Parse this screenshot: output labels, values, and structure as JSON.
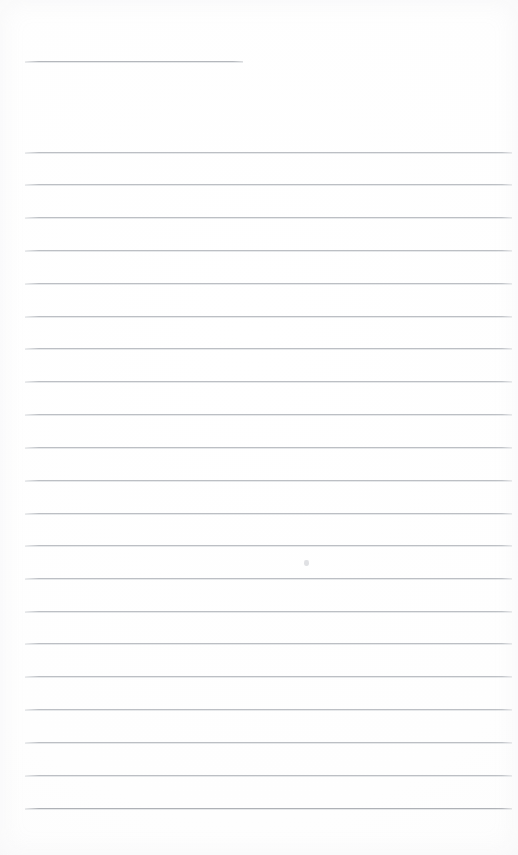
{
  "document": {
    "kind": "blank-ruled-page",
    "title_text": "",
    "body_text": "",
    "visible_text_count": 0,
    "page_background_color": "#ffffff",
    "rule_color": "#bcbfc4",
    "header_rule_color": "#b4b7bc",
    "last_rule_color": "#aeb1b6",
    "page_width": 518,
    "page_height": 855
  },
  "header_rule": {
    "label": "",
    "x": 25,
    "y": 61,
    "width": 218
  },
  "body_rules": {
    "label": "",
    "x": 25,
    "width": 487,
    "count": 21,
    "spacing": 32.8,
    "y_positions": [
      152,
      184,
      217,
      250,
      283,
      316,
      348,
      381,
      414,
      447,
      480,
      513,
      545,
      578,
      611,
      643,
      676,
      709,
      742,
      775,
      808
    ]
  },
  "artifacts": {
    "speck": {
      "label": "",
      "x": 304,
      "y": 560
    }
  }
}
